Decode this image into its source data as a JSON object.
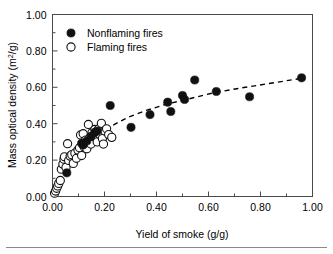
{
  "chart_data": {
    "type": "scatter",
    "title": "",
    "xlabel": "Yield of smoke (g/g)",
    "ylabel": "Mass optical density (m²/g)",
    "ylabel_base": "Mass optical density (m",
    "ylabel_sup": "2",
    "ylabel_tail": "/g)",
    "xlim": [
      0.0,
      1.0
    ],
    "ylim": [
      0.0,
      1.0
    ],
    "grid": false,
    "legend_position": "upper-left-inside",
    "x_ticks": [
      0.0,
      0.2,
      0.4,
      0.6,
      0.8,
      1.0
    ],
    "x_tick_labels": [
      "0.00",
      "0.20",
      "0.40",
      "0.60",
      "0.80",
      "1.00"
    ],
    "x_minor_ticks": [
      0.1,
      0.3,
      0.5,
      0.7,
      0.9
    ],
    "y_ticks": [
      0.0,
      0.2,
      0.4,
      0.6,
      0.8,
      1.0
    ],
    "y_tick_labels": [
      "0.00",
      "0.20",
      "0.40",
      "0.60",
      "0.80",
      "1.00"
    ],
    "y_minor_ticks": [
      0.1,
      0.3,
      0.5,
      0.7,
      0.9
    ],
    "series": [
      {
        "name": "Nonflaming fires",
        "marker": "filled-circle",
        "color": "#111111",
        "points": [
          [
            0.055,
            0.13
          ],
          [
            0.112,
            0.292
          ],
          [
            0.118,
            0.283
          ],
          [
            0.132,
            0.305
          ],
          [
            0.148,
            0.33
          ],
          [
            0.163,
            0.352
          ],
          [
            0.172,
            0.36
          ],
          [
            0.222,
            0.5
          ],
          [
            0.302,
            0.38
          ],
          [
            0.375,
            0.45
          ],
          [
            0.443,
            0.518
          ],
          [
            0.455,
            0.467
          ],
          [
            0.5,
            0.555
          ],
          [
            0.508,
            0.533
          ],
          [
            0.547,
            0.64
          ],
          [
            0.63,
            0.577
          ],
          [
            0.758,
            0.548
          ],
          [
            0.958,
            0.652
          ]
        ]
      },
      {
        "name": "Flaming fires",
        "marker": "open-circle",
        "color": "#111111",
        "points": [
          [
            0.008,
            0.018
          ],
          [
            0.012,
            0.03
          ],
          [
            0.016,
            0.045
          ],
          [
            0.02,
            0.058
          ],
          [
            0.024,
            0.072
          ],
          [
            0.03,
            0.088
          ],
          [
            0.034,
            0.15
          ],
          [
            0.04,
            0.178
          ],
          [
            0.044,
            0.205
          ],
          [
            0.046,
            0.218
          ],
          [
            0.052,
            0.16
          ],
          [
            0.058,
            0.29
          ],
          [
            0.062,
            0.198
          ],
          [
            0.068,
            0.222
          ],
          [
            0.074,
            0.23
          ],
          [
            0.08,
            0.182
          ],
          [
            0.086,
            0.238
          ],
          [
            0.092,
            0.21
          ],
          [
            0.098,
            0.255
          ],
          [
            0.104,
            0.268
          ],
          [
            0.108,
            0.338
          ],
          [
            0.112,
            0.225
          ],
          [
            0.118,
            0.345
          ],
          [
            0.122,
            0.272
          ],
          [
            0.128,
            0.31
          ],
          [
            0.132,
            0.262
          ],
          [
            0.138,
            0.396
          ],
          [
            0.142,
            0.318
          ],
          [
            0.148,
            0.288
          ],
          [
            0.152,
            0.352
          ],
          [
            0.158,
            0.335
          ],
          [
            0.163,
            0.368
          ],
          [
            0.168,
            0.355
          ],
          [
            0.172,
            0.3
          ],
          [
            0.178,
            0.372
          ],
          [
            0.182,
            0.34
          ],
          [
            0.188,
            0.402
          ],
          [
            0.192,
            0.318
          ],
          [
            0.196,
            0.288
          ],
          [
            0.202,
            0.36
          ],
          [
            0.208,
            0.372
          ],
          [
            0.216,
            0.34
          ],
          [
            0.228,
            0.325
          ]
        ]
      }
    ],
    "trend_line": {
      "style": "dashed",
      "color": "#000000",
      "points": [
        [
          0.18,
          0.33
        ],
        [
          0.23,
          0.39
        ],
        [
          0.29,
          0.435
        ],
        [
          0.36,
          0.473
        ],
        [
          0.44,
          0.508
        ],
        [
          0.52,
          0.535
        ],
        [
          0.62,
          0.57
        ],
        [
          0.72,
          0.595
        ],
        [
          0.83,
          0.62
        ],
        [
          0.96,
          0.65
        ]
      ]
    }
  },
  "legend": {
    "entries": [
      {
        "label": "Nonflaming fires",
        "marker": "filled-circle"
      },
      {
        "label": "Flaming fires",
        "marker": "open-circle"
      }
    ]
  }
}
